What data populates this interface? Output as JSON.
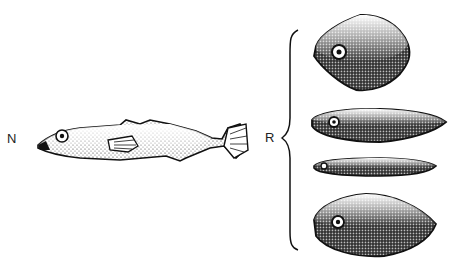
{
  "figure": {
    "labels": {
      "natural": "N",
      "models": "R"
    },
    "items": [
      {
        "id": "natural-fish",
        "group": "N",
        "shape": "realistic-fish"
      },
      {
        "id": "model-1",
        "group": "R",
        "shape": "rhomboid"
      },
      {
        "id": "model-2",
        "group": "R",
        "shape": "elongated-spindle"
      },
      {
        "id": "model-3",
        "group": "R",
        "shape": "thin-spindle"
      },
      {
        "id": "model-4",
        "group": "R",
        "shape": "oval-lens"
      }
    ],
    "colors": {
      "ink": "#111111",
      "background": "#ffffff"
    }
  }
}
